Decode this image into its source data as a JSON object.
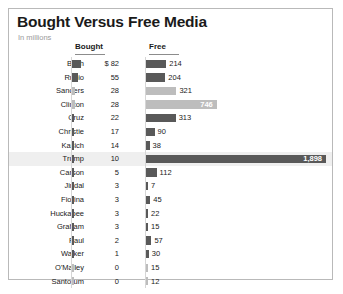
{
  "chart_data": {
    "type": "bar",
    "title": "Bought Versus Free Media",
    "subtitle": "In millions",
    "xlabel": "",
    "ylabel": "",
    "grid": false,
    "legend_position": "none",
    "columns": [
      "Bought",
      "Free"
    ],
    "categories": [
      "Bush",
      "Rubio",
      "Sanders",
      "Clinton",
      "Cruz",
      "Christie",
      "Kasich",
      "Trump",
      "Carson",
      "Jindal",
      "Fiorina",
      "Huckabee",
      "Graham",
      "Paul",
      "Walker",
      "O'Malley",
      "Santorum"
    ],
    "series": [
      {
        "name": "Bought",
        "values": [
          82,
          55,
          28,
          28,
          22,
          17,
          14,
          10,
          5,
          3,
          3,
          3,
          3,
          2,
          1,
          0,
          0
        ]
      },
      {
        "name": "Free",
        "values": [
          214,
          204,
          321,
          746,
          313,
          90,
          38,
          1898,
          112,
          7,
          45,
          22,
          15,
          57,
          30,
          15,
          12
        ]
      }
    ],
    "bought_labels": [
      "$ 82",
      "55",
      "28",
      "28",
      "22",
      "17",
      "14",
      "10",
      "5",
      "3",
      "3",
      "3",
      "3",
      "2",
      "1",
      "0",
      "0"
    ],
    "free_labels": [
      "214",
      "204",
      "321",
      "746",
      "313",
      "90",
      "38",
      "1,898",
      "112",
      "7",
      "45",
      "22",
      "15",
      "57",
      "30",
      "15",
      "12"
    ],
    "party_shade": [
      "dark",
      "dark",
      "light",
      "light",
      "dark",
      "dark",
      "dark",
      "dark",
      "dark",
      "dark",
      "dark",
      "dark",
      "dark",
      "dark",
      "dark",
      "light",
      "light"
    ],
    "highlight_row": "Trump",
    "colors": {
      "dark_bar": "#595959",
      "light_bar": "#bdbdbd",
      "highlight_row": "#efefef",
      "border": "#b9b9b9",
      "text": "#1a1a1a",
      "subtitle": "#9a9a9a"
    }
  }
}
